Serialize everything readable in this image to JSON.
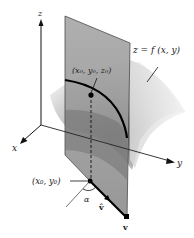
{
  "diagram": {
    "type": "3d-surface-directional-derivative",
    "axes": {
      "x_label": "x",
      "y_label": "y",
      "z_label": "z"
    },
    "surface_label": "z = f (x, y)",
    "point_3d_label": "(x₀, y₀, z₀)",
    "point_2d_label": "(x₀, y₀)",
    "angle_label": "α",
    "unit_vector_label": "v̂",
    "vector_label": "v",
    "colors": {
      "plane_fill": "#8e8e8e",
      "surface_light": "#e8e8e8",
      "surface_dark": "#6a6a6a",
      "line": "#111111",
      "background": "#ffffff"
    }
  }
}
